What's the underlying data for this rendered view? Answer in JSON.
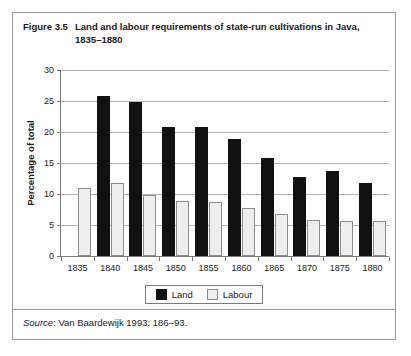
{
  "figure": {
    "label": "Figure 3.5",
    "caption": "Land and labour requirements of state-run cultivations in Java, 1835–1880",
    "source_prefix": "Source",
    "source_text": ": Van Baardewijk 1993: 186–93."
  },
  "colors": {
    "land": "#111111",
    "labour": "#eeeeee",
    "labour_border": "#8c8c8c",
    "grid": "#b3b3b3",
    "axis": "#7a7a7a",
    "frame": "#9a9a9a",
    "text": "#1a1a1a"
  },
  "chart_data": {
    "type": "bar",
    "title": "Land and labour requirements of state-run cultivations in Java, 1835–1880",
    "xlabel": "",
    "ylabel": "Percentage of total",
    "categories": [
      "1835",
      "1840",
      "1845",
      "1850",
      "1855",
      "1860",
      "1865",
      "1870",
      "1875",
      "1880"
    ],
    "series": [
      {
        "name": "Land",
        "values": [
          null,
          25.8,
          24.8,
          20.8,
          20.8,
          18.8,
          15.8,
          12.8,
          13.7,
          11.7
        ]
      },
      {
        "name": "Labour",
        "values": [
          10.9,
          11.8,
          9.8,
          8.9,
          8.7,
          7.8,
          6.8,
          5.8,
          5.7,
          5.6
        ]
      }
    ],
    "ylim": [
      0,
      30
    ],
    "yticks": [
      0,
      5,
      10,
      15,
      20,
      25,
      30
    ],
    "ytick_labels": [
      "0",
      "5",
      "10",
      "15",
      "20",
      "25",
      "30"
    ],
    "grid": true,
    "legend_position": "bottom",
    "legend_entries": [
      "Land",
      "Labour"
    ]
  }
}
